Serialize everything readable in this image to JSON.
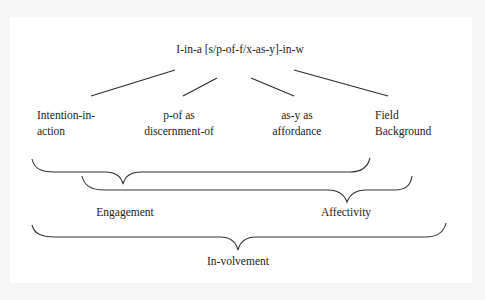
{
  "diagram": {
    "root": "I-in-a [s/p-of-f/x-as-y]-in-w",
    "nodes": [
      {
        "line1": "Intention-in-",
        "line2": "action"
      },
      {
        "line1": "p-of as",
        "line2": "discernment-of"
      },
      {
        "line1": "as-y as",
        "line2": "affordance"
      },
      {
        "line1": "Field",
        "line2": "Background"
      }
    ],
    "groups": {
      "engagement": "Engagement",
      "affectivity": "Affectivity",
      "involvement": "In-volvement"
    },
    "colors": {
      "background": "#ffffff",
      "frame": "#f6f6f6",
      "ink": "#222222"
    }
  }
}
